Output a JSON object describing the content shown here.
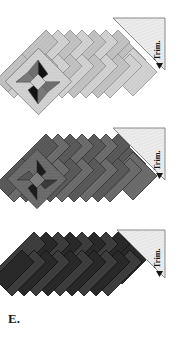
{
  "figure": {
    "caption": "E.",
    "width": 175,
    "height": 337,
    "background": "#ffffff"
  },
  "labels": {
    "trim_1": "Trim.",
    "trim_2": "Trim.",
    "trim_3": "Trim."
  },
  "colors": {
    "panel_light_fill": "#d2d2d2",
    "panel_light_alt": "#c2c2c2",
    "panel_light_edge": "#8e8e8e",
    "panel_mid_fill": "#6d6d6d",
    "panel_mid_alt": "#5c5c5c",
    "panel_mid_edge": "#3a3a3a",
    "panel_dark_fill": "#3d3d3d",
    "panel_dark_alt": "#2b2b2b",
    "panel_dark_edge": "#161616",
    "star_black": "#121212",
    "star_gray": "#6e6e6e",
    "star_light": "#d8d8d8",
    "trim_triangle_fill": "#e8e8e8",
    "trim_triangle_edge": "#7d7d7d",
    "outline": "#4a4a4a",
    "caption_color": "#1a1a1a",
    "background": "#ffffff"
  },
  "panels": [
    {
      "id": "panel-a",
      "tone": "light",
      "strip_count": 11,
      "has_star_block": true,
      "star_position": "left",
      "trim_label": "Trim.",
      "y_top": 18,
      "y_bottom": 124
    },
    {
      "id": "panel-b",
      "tone": "medium",
      "strip_count": 11,
      "has_star_block": true,
      "star_position": "left",
      "trim_label": "Trim.",
      "y_top": 128,
      "y_bottom": 224
    },
    {
      "id": "panel-c",
      "tone": "dark",
      "strip_count": 11,
      "has_star_block": false,
      "star_position": "none",
      "trim_label": "Trim.",
      "y_top": 230,
      "y_bottom": 306
    }
  ]
}
